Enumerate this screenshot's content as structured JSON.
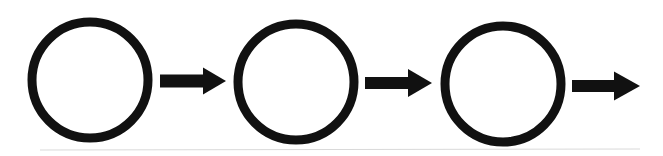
{
  "diagram": {
    "type": "flow-sequence",
    "width": 663,
    "height": 156,
    "background": "#ffffff",
    "stroke_color": "#111111",
    "baseline_color": "#d9d9d9",
    "baseline": {
      "x1": 40,
      "y1": 150,
      "x2": 640,
      "y2": 149,
      "width": 1
    },
    "circle_stroke_width": 9,
    "nodes": [
      {
        "id": "node-1",
        "cx": 90,
        "cy": 80,
        "r": 58,
        "label": ""
      },
      {
        "id": "node-2",
        "cx": 296,
        "cy": 82,
        "r": 58,
        "label": ""
      },
      {
        "id": "node-3",
        "cx": 503,
        "cy": 84,
        "r": 58,
        "label": ""
      }
    ],
    "arrows": [
      {
        "id": "arrow-1",
        "from": "node-1",
        "to": "node-2",
        "shaft_x1": 160,
        "shaft_x2": 203,
        "y": 81,
        "shaft_half": 6.5,
        "head_half": 13.5,
        "tip_x": 226
      },
      {
        "id": "arrow-2",
        "from": "node-2",
        "to": "node-3",
        "shaft_x1": 365,
        "shaft_x2": 408,
        "y": 83,
        "shaft_half": 6,
        "head_half": 14,
        "tip_x": 432
      },
      {
        "id": "arrow-3",
        "from": "node-3",
        "to": null,
        "shaft_x1": 572,
        "shaft_x2": 614,
        "y": 86,
        "shaft_half": 6,
        "head_half": 14.5,
        "tip_x": 640
      }
    ]
  }
}
